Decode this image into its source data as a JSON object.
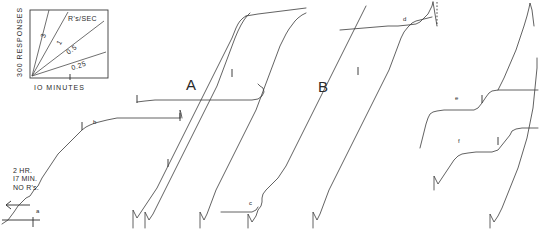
{
  "figure": {
    "kind": "cumulative-response-record",
    "width": 539,
    "height": 230,
    "background": "#ffffff",
    "ink_color": "#3a3a3a"
  },
  "legend": {
    "name": "rate-calibration-box",
    "title": "R's/SEC",
    "y_axis_label": "300 RESPONSES",
    "x_axis_label": "IO MINUTES",
    "rate_lines": [
      {
        "label": "3",
        "value": 3
      },
      {
        "label": "1",
        "value": 1
      },
      {
        "label": "0.5",
        "value": 0.5
      },
      {
        "label": "0.25",
        "value": 0.25
      }
    ],
    "box": {
      "x": 30,
      "y": 10,
      "width": 78,
      "height": 68
    }
  },
  "annotations": {
    "pause_note": "2 HR.\nI7 MIN.\nNO R's.",
    "section_labels": [
      {
        "text": "A",
        "x": 186,
        "y": 84
      },
      {
        "text": "B",
        "x": 318,
        "y": 86
      }
    ],
    "event_labels": [
      {
        "text": "a",
        "x": 36,
        "y": 213
      },
      {
        "text": "b",
        "x": 93,
        "y": 124
      },
      {
        "text": "c",
        "x": 249,
        "y": 205
      },
      {
        "text": "d",
        "x": 403,
        "y": 21
      },
      {
        "text": "e",
        "x": 455,
        "y": 100
      },
      {
        "text": "f",
        "x": 458,
        "y": 143
      }
    ]
  },
  "chart_data": {
    "type": "line",
    "title": "",
    "xlabel": "IO MINUTES",
    "ylabel": "300 RESPONSES",
    "grid": false,
    "legend_position": "top-left",
    "categories": [],
    "series": [
      {
        "name": "segment-1",
        "note": "starts after 2 HR. I7 MIN. NO R's., rises through a, plateau after b",
        "points": "2,224 8,220 14,212 18,206 22,202 26,198 30,196 34,190 38,186 42,178 46,172 50,166 54,160 58,154 62,150 66,146 70,142 74,138 78,134 82,130 86,127 90,125 95,123 99,122 103,121 107,120 112,119 117,118 124,118 132,118 140,118 150,118 160,118 170,118 178,118 180,118"
      },
      {
        "name": "segment-1-reset",
        "note": "pen reset drop at end of first strip",
        "points": "180,118 180,110 181,113 182,118"
      },
      {
        "name": "segment-2",
        "note": "A region lower trace, steep run from baseline",
        "points": "133,228 133,210 135,214 137,218 141,212 145,206 149,200 153,194 157,188 160,182 163,176 166,170 169,164 172,158 175,152 178,146 181,140 184,134 187,128 190,122 193,116 196,110 199,104 202,98 205,92 208,86 211,80 214,74 217,68 220,62 223,56 226,50 229,44 232,38 234,33 236,28 238,24 240,21 243,18 246,16"
      },
      {
        "name": "segment-2b",
        "note": "parallel steeper trace in A region",
        "points": "145,228 145,212 147,216 149,220 153,214 157,206 161,198 165,190 169,182 173,174 177,166 181,158 185,150 189,142 193,134 197,126 201,118 205,110 209,102 213,94 217,86 220,78 223,70 226,62 229,54 232,46 235,38 238,31 241,25 244,20 247,16 250,13"
      },
      {
        "name": "segment-2-top-plateau",
        "points": "246,16 252,15 258,14 266,13 274,12 282,11 290,10 298,9 306,8"
      },
      {
        "name": "segment-3",
        "note": "A region mid plateau with tick at 137,100",
        "points": "137,102 145,101 155,100 165,100 175,100 185,100 195,100 205,100 215,100 225,100 235,100 245,100 252,100 258,99 262,96 264,92 263,88 260,86 258,84"
      },
      {
        "name": "segment-4",
        "note": "rise through c up to upper right of A",
        "points": "200,228 200,212 202,216 204,220 207,214 210,206 213,198 216,190 220,182 224,174 228,166 232,158 236,150 240,142 244,134 248,126 252,118 256,110 259,102 262,94 265,86 268,78 271,70 274,62 277,54 280,46 283,40 286,34 289,29 292,25 295,21 298,18 302,15 306,13"
      },
      {
        "name": "segment-5-c",
        "note": "lower plateau leading to c then rise",
        "points": "248,228 248,214 250,218 252,222 256,216 258,210 261,206 262,202 262,198 263,194 266,190 270,186 274,182 278,178 282,172 286,166 289,160 292,154 295,148 298,142 301,136 304,130 307,124 310,118 313,112 316,106 319,100 322,94 325,88 328,82 331,76 334,70 337,64 340,58 343,52 346,46 349,40 352,34 355,28 358,22 361,16 364,10 366,6"
      },
      {
        "name": "segment-5-flat",
        "points": "221,212 232,212 244,212 252,212 256,210 258,207"
      },
      {
        "name": "segment-6",
        "note": "B region long steep run to d plateau",
        "points": "313,228 313,212 315,216 317,220 320,214 323,206 326,198 329,190 333,182 337,174 341,166 345,158 349,150 353,142 357,134 361,126 365,118 369,110 373,102 377,94 381,86 385,78 389,70 392,62 395,54 398,46 401,38 404,32 408,27 412,23 416,21 420,20 424,19 428,18 432,17"
      },
      {
        "name": "segment-6-d-plateau",
        "points": "340,30 352,29 364,28 376,27 388,26 398,26 408,25 416,24 420,22 424,18 428,14 430,10 432,6 433,2"
      },
      {
        "name": "segment-6-spike",
        "points": "433,2 434,8 435,14 436,20 437,26"
      },
      {
        "name": "segment-7-e",
        "note": "e plateau step then rise",
        "points": "420,148 422,140 424,132 426,124 428,118 430,114 433,112 437,111 444,110 452,110 460,110 468,110 474,110 478,108 482,103 486,97 489,93 492,91 498,90 506,90 514,90 522,90 530,90 538,90"
      },
      {
        "name": "segment-8-f",
        "note": "f lower plateau step",
        "points": "434,190 434,176 436,180 438,184 442,178 446,172 450,166 454,160 458,156 462,154 468,153 476,152 484,152 492,152 498,150 502,145 506,140 510,135 512,131 516,129 522,128 530,128 538,128"
      },
      {
        "name": "segment-9-right",
        "note": "far right steep riser with reset",
        "points": "490,228 490,214 492,218 494,222 498,216 502,208 506,198 510,188 514,178 518,168 521,158 524,148 527,138 529,128 531,118 533,108 534,98 535,88 536,78 537,68 537,58"
      },
      {
        "name": "segment-10-top-right",
        "points": "498,90 504,78 510,64 516,50 520,38 524,26 527,16 529,8 530,3 532,10 533,18 534,26"
      }
    ],
    "event_ticks": [
      {
        "x": 82,
        "y": 127
      },
      {
        "x": 180,
        "y": 118
      },
      {
        "x": 137,
        "y": 100
      },
      {
        "x": 232,
        "y": 74
      },
      {
        "x": 358,
        "y": 72
      },
      {
        "x": 482,
        "y": 100
      },
      {
        "x": 498,
        "y": 142
      },
      {
        "x": 168,
        "y": 164
      }
    ],
    "baseline": {
      "x1": 2,
      "y1": 220,
      "x2": 40,
      "y2": 220,
      "tick_x": 33
    }
  }
}
